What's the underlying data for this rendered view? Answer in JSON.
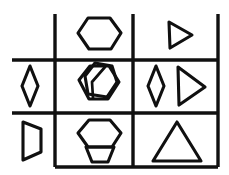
{
  "figure": {
    "kind": "matrix-reasoning-puzzle",
    "width": 229,
    "height": 175,
    "background_color": "#ffffff",
    "ink_color": "#101010"
  },
  "grid": {
    "rows": 3,
    "columns": 3,
    "line_color": "#101010",
    "line_width": 3.4,
    "vertical_lines_x": [
      55,
      133,
      218
    ],
    "horizontal_lines_y": [
      60,
      113,
      167
    ],
    "grid_left": 12,
    "grid_top": 14,
    "notes": "no outer border on top edge or left edge; first column opens to the left and top"
  },
  "cells": [
    {
      "id": "r1c1",
      "row": 1,
      "column": 1,
      "row_label": "row-1",
      "column_label": "column-1",
      "content": "empty",
      "shapes": []
    },
    {
      "id": "r1c2",
      "row": 1,
      "column": 2,
      "row_label": "row-1",
      "column_label": "column-2",
      "content": "hexagon",
      "shapes": [
        {
          "name": "hexagon",
          "orientation": "flat-left-right",
          "size": "large",
          "count": 1
        }
      ]
    },
    {
      "id": "r1c3",
      "row": 1,
      "column": 3,
      "row_label": "row-1",
      "column_label": "column-3",
      "content": "right-pointing triangle",
      "shapes": [
        {
          "name": "triangle-right",
          "orientation": "points-right",
          "size": "medium",
          "count": 1
        }
      ]
    },
    {
      "id": "r2c1",
      "row": 2,
      "column": 1,
      "row_label": "row-2",
      "column_label": "column-1",
      "content": "narrow vertical diamond",
      "shapes": [
        {
          "name": "diamond",
          "orientation": "vertical",
          "size": "small",
          "count": 1
        }
      ]
    },
    {
      "id": "r2c2",
      "row": 2,
      "column": 2,
      "row_label": "row-2",
      "column_label": "column-2",
      "content": "two overlapping hexagons",
      "shapes": [
        {
          "name": "hexagon",
          "orientation": "flat-left-right",
          "size": "large",
          "count": 1
        },
        {
          "name": "hexagon",
          "orientation": "rotated-overlapping",
          "size": "large",
          "count": 1
        }
      ]
    },
    {
      "id": "r2c3",
      "row": 2,
      "column": 3,
      "row_label": "row-2",
      "column_label": "column-3",
      "content": "narrow vertical diamond and right-pointing triangle",
      "shapes": [
        {
          "name": "diamond",
          "orientation": "vertical",
          "size": "small",
          "count": 1
        },
        {
          "name": "triangle-right",
          "orientation": "points-right",
          "size": "medium",
          "count": 1
        }
      ]
    },
    {
      "id": "r3c1",
      "row": 3,
      "column": 1,
      "row_label": "row-3",
      "column_label": "column-1",
      "content": "right-pointing quadrilateral (D shape)",
      "shapes": [
        {
          "name": "quadrilateral-d",
          "orientation": "points-right",
          "size": "small",
          "count": 1
        }
      ]
    },
    {
      "id": "r3c2",
      "row": 3,
      "column": 2,
      "row_label": "row-3",
      "column_label": "column-2",
      "content": "hexagon above inverted trapezoid",
      "shapes": [
        {
          "name": "hexagon",
          "orientation": "flat-left-right",
          "size": "large",
          "count": 1
        },
        {
          "name": "trapezoid-inverted",
          "orientation": "narrow-bottom",
          "size": "medium",
          "count": 1
        }
      ]
    },
    {
      "id": "r3c3",
      "row": 3,
      "column": 3,
      "row_label": "row-3",
      "column_label": "column-3",
      "content": "upward-pointing triangle",
      "shapes": [
        {
          "name": "triangle-up",
          "orientation": "points-up",
          "size": "large",
          "count": 1
        }
      ]
    }
  ],
  "geometry": {
    "r1c2_hexagon": "M 78,33 L 88,18 L 110,18 L 121,33 L 111,49 L 89,49 Z",
    "r1c3_triangle": "M 169,22 L 192,35 L 170,48 Z",
    "r2c1_diamond": "M 30,66 L 38,86 L 30,106 L 22,86 Z",
    "r2c2_hexagon_back": "M 85,76 L 95,63 L 112,66 L 117,82 L 107,97 L 88,94 Z",
    "r2c2_hexagon_front": "M 79,80 L 90,66 L 109,66 L 119,82 L 108,99 L 89,99 Z",
    "r2c2_inner": "M 93,98 L 92,82 L 105,67",
    "r2c3_diamond": "M 156,66 L 164,86 L 156,106 L 148,86 Z",
    "r2c3_triangle": "M 178,67 L 205,87 L 179,105 Z",
    "r3c1_quad": "M 23,122 L 41,129 L 41,152 L 23,160 Z",
    "r3c2_hexagon": "M 78,133 L 89,120 L 110,120 L 121,133 L 112,147 L 88,147 Z",
    "r3c2_trapezoid": "M 86,147 L 114,147 L 108,162 L 92,162 Z",
    "r3c3_triangle": "M 177,122 L 201,161 L 153,161 Z"
  }
}
